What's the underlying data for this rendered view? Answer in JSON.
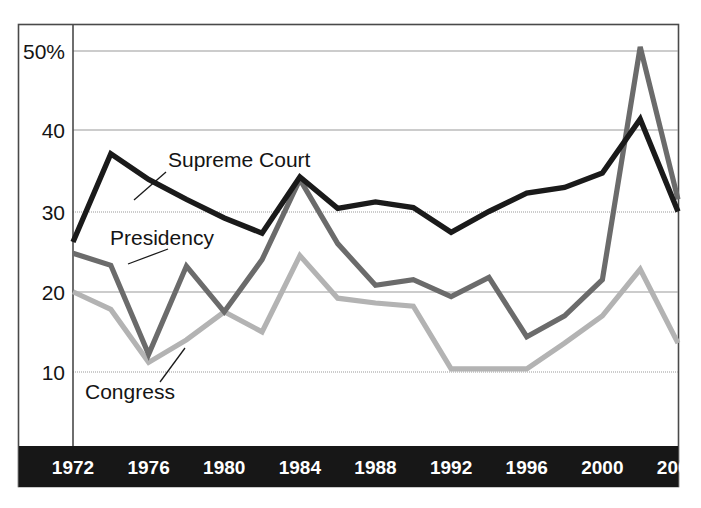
{
  "chart_data": {
    "type": "line",
    "title": "",
    "subtitle": "",
    "xlabel": "",
    "ylabel": "",
    "xlim": [
      1972,
      2004
    ],
    "ylim": [
      5,
      55
    ],
    "grid": true,
    "grid_axis": "y",
    "legend_position": "inline-annotations",
    "x": [
      1972,
      1974,
      1976,
      1978,
      1980,
      1982,
      1984,
      1986,
      1988,
      1990,
      1992,
      1994,
      1996,
      1998,
      2000,
      2002,
      2004
    ],
    "xtick_labels": [
      "1972",
      "1976",
      "1980",
      "1984",
      "1988",
      "1992",
      "1996",
      "2000",
      "2004"
    ],
    "xtick_values": [
      1972,
      1976,
      1980,
      1984,
      1988,
      1992,
      1996,
      2000,
      2004
    ],
    "ytick_labels": [
      "50%",
      "40",
      "30",
      "20",
      "10"
    ],
    "ytick_values": [
      50,
      40,
      30,
      20,
      10
    ],
    "series": [
      {
        "name": "Supreme Court",
        "color": "#1a1a1a",
        "values": [
          26.2,
          37.2,
          34.0,
          31.5,
          29.2,
          27.3,
          34.3,
          30.4,
          31.2,
          30.5,
          27.4,
          30.0,
          32.3,
          33.0,
          34.8,
          41.5,
          30.0
        ]
      },
      {
        "name": "Presidency",
        "color": "#6b6b6b",
        "values": [
          24.8,
          23.3,
          12.2,
          23.2,
          17.5,
          24.0,
          34.0,
          26.0,
          20.8,
          21.5,
          19.4,
          21.8,
          14.4,
          17.0,
          21.5,
          50.5,
          31.5
        ]
      },
      {
        "name": "Congress",
        "color": "#b3b3b3",
        "values": [
          20.0,
          17.8,
          11.2,
          14.0,
          17.5,
          15.0,
          24.5,
          19.2,
          18.6,
          18.2,
          10.4,
          10.4,
          10.4,
          13.6,
          17.0,
          22.8,
          13.6
        ]
      }
    ],
    "annotations": [
      {
        "name": "Supreme Court",
        "text": "Supreme Court",
        "label_x": 168,
        "label_y": 167,
        "leader_from_x": 166,
        "leader_from_y": 172,
        "leader_to_x": 134,
        "leader_to_y": 200
      },
      {
        "name": "Presidency",
        "text": "Presidency",
        "label_x": 110,
        "label_y": 245,
        "leader_from_x": 168,
        "leader_from_y": 249,
        "leader_to_x": 128,
        "leader_to_y": 264
      },
      {
        "name": "Congress",
        "text": "Congress",
        "label_x": 85,
        "label_y": 399,
        "leader_from_x": 160,
        "leader_from_y": 382,
        "leader_to_x": 185,
        "leader_to_y": 348
      }
    ]
  },
  "axis_band": {
    "background_color": "#171717",
    "text_color": "#ffffff"
  },
  "frame": {
    "border_color": "#444444",
    "grid_color": "#9a9a9a",
    "background_color": "#ffffff"
  }
}
